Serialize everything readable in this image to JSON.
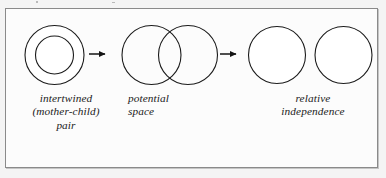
{
  "figure": {
    "type": "conceptual-diagram",
    "background_color": "#f4f4f4",
    "panel_color": "#fcfcfc",
    "border_color": "#8a8a8a",
    "ink_color": "#1b1b1b"
  },
  "stages": [
    {
      "id": "intertwined",
      "label": "intertwined\n(mother-child)\npair",
      "glyph": "concentric-circles",
      "shapes": [
        {
          "name": "outer-circle",
          "cx": 54.5,
          "cy": 55,
          "r": 29.5
        },
        {
          "name": "inner-circle",
          "cx": 54.5,
          "cy": 55,
          "r": 19
        }
      ]
    },
    {
      "id": "potential-space",
      "label": "potential\nspace",
      "glyph": "overlapping-circles",
      "shapes": [
        {
          "name": "left-circle",
          "cx": 151.5,
          "cy": 55,
          "r": 29.5
        },
        {
          "name": "right-circle",
          "cx": 188,
          "cy": 55,
          "r": 29.5
        }
      ]
    },
    {
      "id": "relative-independence",
      "label": "relative\nindependence",
      "glyph": "separate-circles",
      "shapes": [
        {
          "name": "left-circle",
          "cx": 277,
          "cy": 55,
          "r": 28.5
        },
        {
          "name": "right-circle",
          "cx": 343.5,
          "cy": 55,
          "r": 28.5
        }
      ]
    }
  ],
  "arrows": [
    {
      "id": "arrow-1",
      "from": "intertwined",
      "to": "potential-space",
      "x1": 89,
      "x2": 112,
      "y": 54
    },
    {
      "id": "arrow-2",
      "from": "potential-space",
      "to": "relative-independence",
      "x1": 220,
      "x2": 243,
      "y": 54
    }
  ]
}
